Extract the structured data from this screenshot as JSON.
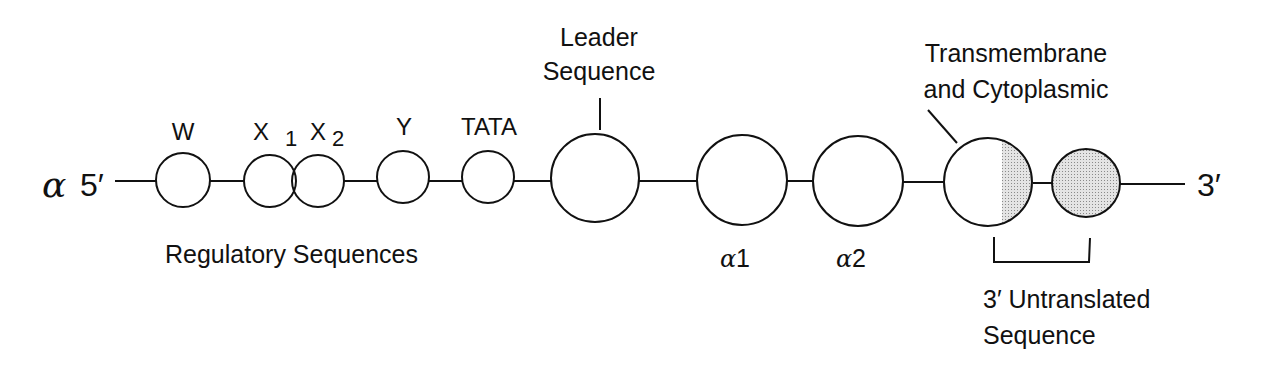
{
  "diagram": {
    "gene_label": "α",
    "five_prime": "5′",
    "three_prime": "3′",
    "elements": [
      {
        "id": "W",
        "label": "W",
        "cx": 183,
        "r": 27,
        "fill": "none"
      },
      {
        "id": "X1",
        "label": "X",
        "sub": "1",
        "cx": 270,
        "r": 26,
        "fill": "none"
      },
      {
        "id": "X2",
        "label": "X",
        "sub": "2",
        "cx": 318,
        "r": 26,
        "fill": "none"
      },
      {
        "id": "Y",
        "label": "Y",
        "cx": 403,
        "r": 26,
        "fill": "none"
      },
      {
        "id": "TATA",
        "label": "TATA",
        "cx": 488,
        "r": 26,
        "fill": "none"
      },
      {
        "id": "leader",
        "label": "",
        "cx": 595,
        "r": 44,
        "fill": "none"
      },
      {
        "id": "a1",
        "label": "α1",
        "cx": 742,
        "r": 45,
        "fill": "none"
      },
      {
        "id": "a2",
        "label": "α2",
        "cx": 858,
        "r": 45,
        "fill": "none"
      },
      {
        "id": "tm",
        "label": "",
        "cx": 988,
        "r": 45,
        "fill": "half"
      },
      {
        "id": "utr",
        "label": "",
        "cx": 1086,
        "r": 34,
        "fill": "full"
      }
    ],
    "labels": {
      "leader_line1": "Leader",
      "leader_line2": "Sequence",
      "tm_line1": "Transmembrane",
      "tm_line2": "and Cytoplasmic",
      "regulatory": "Regulatory Sequences",
      "alpha1_greek": "α",
      "alpha1_num": "1",
      "alpha2_greek": "α",
      "alpha2_num": "2",
      "utr_line1": "3′ Untranslated",
      "utr_line2": "Sequence",
      "W": "W",
      "X1": "X",
      "X1_sub": "1",
      "X2": "X",
      "X2_sub": "2",
      "Y": "Y",
      "TATA": "TATA"
    },
    "colors": {
      "stroke": "#111111",
      "shade": "#cfcfcf"
    }
  }
}
